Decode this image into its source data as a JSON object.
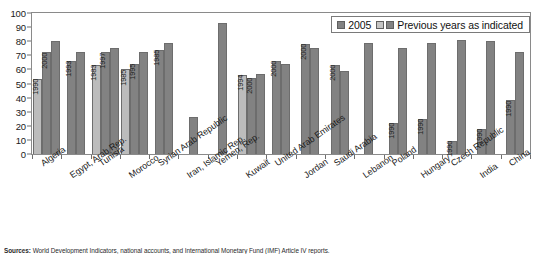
{
  "legend": {
    "series_2005_label": "2005",
    "previous_label": "Previous years as indicated"
  },
  "source": {
    "prefix": "Sources:",
    "text": " World Development Indicators, national accounts, and International Monetary Fund (IMF) Article IV reports."
  },
  "chart_data": {
    "type": "bar",
    "title": "",
    "subtitle": "",
    "xlabel": "",
    "ylabel": "",
    "ylim": [
      0,
      100
    ],
    "yticks": [
      0,
      10,
      20,
      30,
      40,
      50,
      60,
      70,
      80,
      90,
      100
    ],
    "grid": false,
    "legend_position": "top-right",
    "categories": [
      "Algeria",
      "Egypt, Arab Rep.",
      "Tunisia",
      "Morocco",
      "Syrian Arab Republic",
      "Iran, Islamic Rep.",
      "Yemen, Rep.",
      "Kuwait",
      "United Arab Emirates",
      "Jordan",
      "Saudi Arabia",
      "Lebanon",
      "Poland",
      "Hungary",
      "Czech Republic",
      "India",
      "China"
    ],
    "groups": [
      {
        "category": "Algeria",
        "bars": [
          {
            "year": "1990",
            "value": 53,
            "shade": "light"
          },
          {
            "year": "2000",
            "value": 72,
            "shade": "dark"
          },
          {
            "year": "2005",
            "value": 80,
            "shade": "dark"
          }
        ]
      },
      {
        "category": "Egypt, Arab Rep.",
        "bars": [
          {
            "year": "1993",
            "value": 66,
            "shade": "dark"
          },
          {
            "year": "2005",
            "value": 72,
            "shade": "dark"
          }
        ]
      },
      {
        "category": "Tunisia",
        "bars": [
          {
            "year": "1983",
            "value": 63,
            "shade": "light"
          },
          {
            "year": "1997",
            "value": 72,
            "shade": "dark"
          },
          {
            "year": "2005",
            "value": 75,
            "shade": "dark"
          }
        ]
      },
      {
        "category": "Morocco",
        "bars": [
          {
            "year": "1985",
            "value": 60,
            "shade": "light"
          },
          {
            "year": "1995",
            "value": 64,
            "shade": "dark"
          },
          {
            "year": "2005",
            "value": 72,
            "shade": "dark"
          }
        ]
      },
      {
        "category": "Syrian Arab Republic",
        "bars": [
          {
            "year": "1985",
            "value": 74,
            "shade": "dark"
          },
          {
            "year": "2005",
            "value": 79,
            "shade": "dark"
          }
        ]
      },
      {
        "category": "Iran, Islamic Rep.",
        "bars": [
          {
            "year": "2005",
            "value": 26,
            "shade": "dark"
          }
        ]
      },
      {
        "category": "Yemen, Rep.",
        "bars": [
          {
            "year": "2005",
            "value": 93,
            "shade": "dark"
          }
        ]
      },
      {
        "category": "Kuwait",
        "bars": [
          {
            "year": "1994",
            "value": 56,
            "shade": "light"
          },
          {
            "year": "2000",
            "value": 54,
            "shade": "dark"
          },
          {
            "year": "2005",
            "value": 57,
            "shade": "dark"
          }
        ]
      },
      {
        "category": "United Arab Emirates",
        "bars": [
          {
            "year": "2000",
            "value": 66,
            "shade": "dark"
          },
          {
            "year": "2005",
            "value": 64,
            "shade": "dark"
          }
        ]
      },
      {
        "category": "Jordan",
        "bars": [
          {
            "year": "2000",
            "value": 78,
            "shade": "dark"
          },
          {
            "year": "2005",
            "value": 75,
            "shade": "dark"
          }
        ]
      },
      {
        "category": "Saudi Arabia",
        "bars": [
          {
            "year": "2000",
            "value": 63,
            "shade": "dark"
          },
          {
            "year": "2005",
            "value": 59,
            "shade": "dark"
          }
        ]
      },
      {
        "category": "Lebanon",
        "bars": [
          {
            "year": "2005",
            "value": 79,
            "shade": "dark"
          }
        ]
      },
      {
        "category": "Poland",
        "bars": [
          {
            "year": "1990",
            "value": 22,
            "shade": "dark"
          },
          {
            "year": "2005",
            "value": 75,
            "shade": "dark"
          }
        ]
      },
      {
        "category": "Hungary",
        "bars": [
          {
            "year": "1990",
            "value": 25,
            "shade": "dark"
          },
          {
            "year": "2005",
            "value": 79,
            "shade": "dark"
          }
        ]
      },
      {
        "category": "Czech Republic",
        "bars": [
          {
            "year": "1990",
            "value": 9,
            "shade": "dark"
          },
          {
            "year": "2005",
            "value": 81,
            "shade": "dark"
          }
        ]
      },
      {
        "category": "India",
        "bars": [
          {
            "year": "1990",
            "value": 18,
            "shade": "dark"
          },
          {
            "year": "2005",
            "value": 80,
            "shade": "dark"
          }
        ]
      },
      {
        "category": "China",
        "bars": [
          {
            "year": "1990",
            "value": 38,
            "shade": "dark"
          },
          {
            "year": "2005",
            "value": 72,
            "shade": "dark"
          }
        ]
      }
    ]
  }
}
